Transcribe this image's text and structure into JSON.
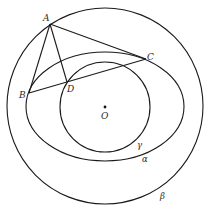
{
  "figure": {
    "stroke_color": "#1a1a1a",
    "background": "#ffffff"
  },
  "curves": {
    "beta": {
      "label": "β",
      "type": "circle",
      "cx": 105,
      "cy": 106,
      "r": 98
    },
    "alpha": {
      "label": "α",
      "type": "ellipse",
      "cx": 105,
      "cy": 106.5,
      "rx": 79,
      "ry": 54.5
    },
    "gamma": {
      "label": "γ",
      "type": "circle",
      "cx": 105,
      "cy": 107,
      "r": 45
    }
  },
  "points": {
    "A": {
      "label": "A",
      "x": 50,
      "y": 24
    },
    "B": {
      "label": "B",
      "x": 29,
      "y": 93
    },
    "C": {
      "label": "C",
      "x": 146,
      "y": 59
    },
    "D": {
      "label": "D",
      "x": 67,
      "y": 82
    },
    "O": {
      "label": "O",
      "x": 105,
      "y": 107
    }
  },
  "segments": [
    {
      "name": "AB",
      "from": "A",
      "to": "B"
    },
    {
      "name": "AC",
      "from": "A",
      "to": "C"
    },
    {
      "name": "AD",
      "from": "A",
      "to": "D"
    },
    {
      "name": "BC",
      "from": "B",
      "to": "C"
    }
  ],
  "labels": {
    "A": "A",
    "B": "B",
    "C": "C",
    "D": "D",
    "O": "O",
    "alpha": "α",
    "beta": "β",
    "gamma": "γ"
  }
}
